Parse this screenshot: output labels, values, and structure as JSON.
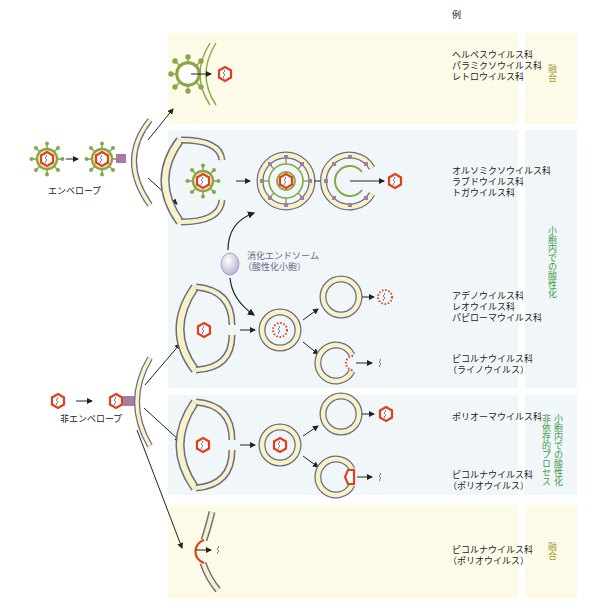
{
  "header": {
    "examples_label": "例"
  },
  "left_labels": {
    "enveloped": "エンベロープ",
    "non_enveloped": "非エンベロープ"
  },
  "endosome_label": {
    "line1": "消化エンドソーム",
    "line2": "（酸性化小胞）"
  },
  "rows": [
    {
      "id": "enveloped-fusion",
      "examples": [
        "ヘルペスウイルス科",
        "パラミクソウイルス科",
        "レトロウイルス科"
      ],
      "mechanism": "融合",
      "band_color": "#fdfbe8"
    },
    {
      "id": "enveloped-endosome",
      "examples": [
        "オルソミクソウイルス科",
        "ラブドウイルス科",
        "トガウイルス科"
      ],
      "mechanism": "小胞内での酸性化",
      "band_color": "#f1f7f8"
    },
    {
      "id": "nonenveloped-endosome-lysis",
      "examples": [
        "アデノウイルス科",
        "レオウイルス科",
        "パピローマウイルス科"
      ],
      "mechanism": "小胞内での酸性化",
      "band_color": "#f1f7f8"
    },
    {
      "id": "nonenveloped-endosome-pore",
      "examples": [
        "ピコルナウイルス科",
        "（ライノウイルス）"
      ],
      "mechanism": "小胞内での酸性化",
      "band_color": "#f1f7f8"
    },
    {
      "id": "nonenveloped-independent-lysis",
      "examples": [
        "ポリオーマウイルス科"
      ],
      "mechanism": [
        "小胞内での酸性化",
        "非依存的プロセス"
      ],
      "band_color": "#f1f7f8"
    },
    {
      "id": "nonenveloped-independent-pore",
      "examples": [
        "ピコルナウイルス科",
        "（ポリオウイルス）"
      ],
      "mechanism": [
        "小胞内での酸性化",
        "非依存的プロセス"
      ],
      "band_color": "#f1f7f8"
    },
    {
      "id": "nonenveloped-fusion",
      "examples": [
        "ピコルナウイルス科",
        "（ポリオウイルス）"
      ],
      "mechanism": "融合",
      "band_color": "#fdfbe8"
    }
  ],
  "colors": {
    "envelope_green": "#8aa646",
    "capsid_red": "#e2401c",
    "membrane_fill": "#f8f3c4",
    "membrane_stroke": "#6d6b8a",
    "receptor_purple": "#a87ca2",
    "genome_purple": "#7c6aa8",
    "fusion_text": "#9c9a30",
    "acid_text": "#3f9a4f"
  }
}
